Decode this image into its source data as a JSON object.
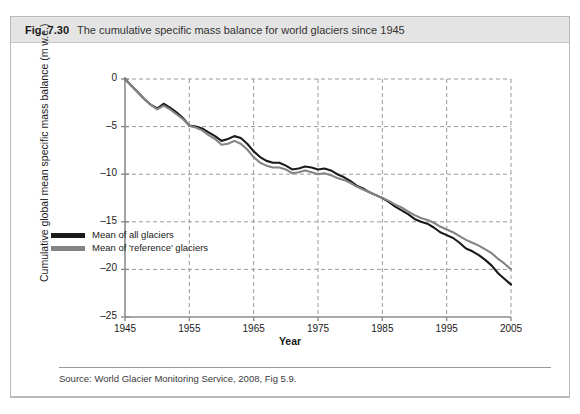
{
  "caption": {
    "number": "Fig. 7.30",
    "text": "The cumulative specific mass balance for world glaciers since 1945"
  },
  "source": {
    "text": "Source: World Glacier Monitoring Service, 2008, Fig 5.9."
  },
  "colors": {
    "all_glaciers": "#1a1a1a",
    "reference_glaciers": "#848484",
    "axis": "#8c8c8c",
    "grid": "#9a9a9a",
    "caption_bar": "#e4e4e4",
    "frame": "#b9b9b9"
  },
  "chart_data": {
    "type": "line",
    "title": "The cumulative specific mass balance for world glaciers since 1945",
    "xlabel": "Year",
    "ylabel": "Cumulative global mean specific mass balance (m w.e.)",
    "xlim": [
      1945,
      2005
    ],
    "ylim": [
      -25,
      0
    ],
    "xticks": [
      1945,
      1955,
      1965,
      1975,
      1985,
      1995,
      2005
    ],
    "yticks": [
      0,
      -5,
      -10,
      -15,
      -20,
      -25
    ],
    "xtick_labels": [
      "1945",
      "1955",
      "1965",
      "1975",
      "1985",
      "1995",
      "2005"
    ],
    "ytick_labels": [
      "0",
      "–5",
      "–10",
      "–15",
      "–20",
      "–25"
    ],
    "grid": true,
    "grid_style": "dashed",
    "legend_position": "inside-lower-left",
    "x": [
      1945,
      1946,
      1947,
      1948,
      1949,
      1950,
      1951,
      1952,
      1953,
      1954,
      1955,
      1956,
      1957,
      1958,
      1959,
      1960,
      1961,
      1962,
      1963,
      1964,
      1965,
      1966,
      1967,
      1968,
      1969,
      1970,
      1971,
      1972,
      1973,
      1974,
      1975,
      1976,
      1977,
      1978,
      1979,
      1980,
      1981,
      1982,
      1983,
      1984,
      1985,
      1986,
      1987,
      1988,
      1989,
      1990,
      1991,
      1992,
      1993,
      1994,
      1995,
      1996,
      1997,
      1998,
      1999,
      2000,
      2001,
      2002,
      2003,
      2004,
      2005
    ],
    "series": [
      {
        "name": "Mean of all glaciers",
        "color": "#1a1a1a",
        "values": [
          0.0,
          -0.7,
          -1.4,
          -2.1,
          -2.7,
          -3.1,
          -2.6,
          -3.0,
          -3.5,
          -4.1,
          -4.9,
          -5.0,
          -5.2,
          -5.6,
          -6.0,
          -6.5,
          -6.3,
          -6.0,
          -6.2,
          -6.8,
          -7.6,
          -8.2,
          -8.6,
          -8.8,
          -8.8,
          -9.1,
          -9.5,
          -9.4,
          -9.2,
          -9.3,
          -9.5,
          -9.4,
          -9.6,
          -10.0,
          -10.3,
          -10.7,
          -11.2,
          -11.5,
          -11.9,
          -12.2,
          -12.5,
          -12.9,
          -13.4,
          -13.8,
          -14.2,
          -14.7,
          -15.0,
          -15.2,
          -15.6,
          -16.1,
          -16.4,
          -16.7,
          -17.2,
          -17.8,
          -18.1,
          -18.5,
          -19.0,
          -19.6,
          -20.4,
          -21.0,
          -21.6
        ]
      },
      {
        "name": "Mean of 'reference' glaciers",
        "color": "#848484",
        "values": [
          0.0,
          -0.7,
          -1.4,
          -2.1,
          -2.7,
          -3.2,
          -2.8,
          -3.2,
          -3.7,
          -4.2,
          -4.9,
          -5.1,
          -5.4,
          -5.9,
          -6.3,
          -6.9,
          -6.8,
          -6.5,
          -6.8,
          -7.4,
          -8.2,
          -8.8,
          -9.1,
          -9.3,
          -9.3,
          -9.5,
          -9.9,
          -9.8,
          -9.6,
          -9.8,
          -10.0,
          -9.9,
          -10.1,
          -10.4,
          -10.6,
          -10.9,
          -11.3,
          -11.6,
          -11.9,
          -12.2,
          -12.5,
          -12.8,
          -13.2,
          -13.5,
          -13.9,
          -14.3,
          -14.6,
          -14.8,
          -15.1,
          -15.5,
          -15.8,
          -16.1,
          -16.5,
          -16.9,
          -17.2,
          -17.5,
          -17.9,
          -18.3,
          -18.9,
          -19.4,
          -20.0
        ]
      }
    ]
  },
  "legend": {
    "items": [
      {
        "label": "Mean of all glaciers",
        "color": "#1a1a1a"
      },
      {
        "label": "Mean of 'reference' glaciers",
        "color": "#848484"
      }
    ]
  }
}
